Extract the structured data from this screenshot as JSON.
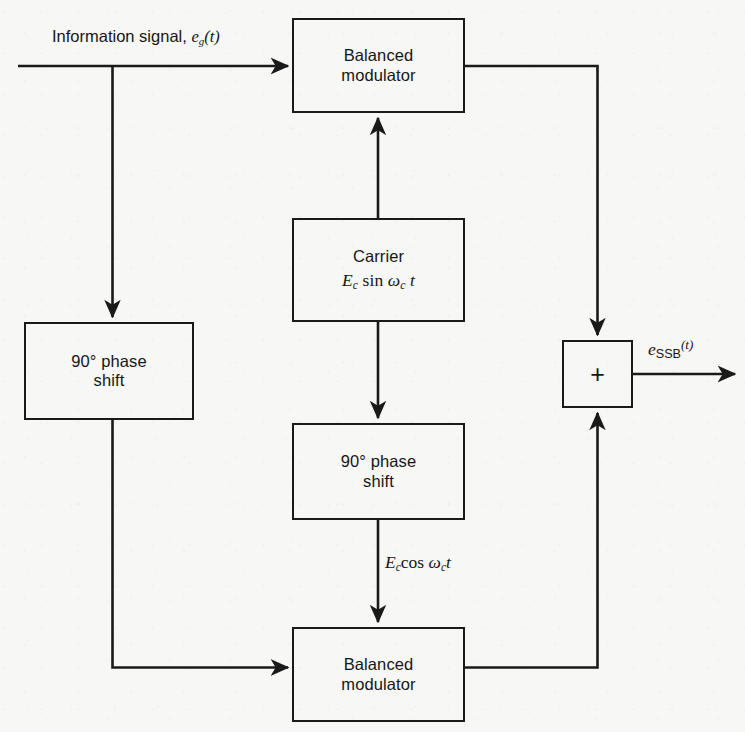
{
  "diagram": {
    "background_color": "#f7f7f5",
    "line_color": "#1a1a1a",
    "text_color": "#161616",
    "input_label": {
      "prefix": "Information signal, ",
      "symbol": "e",
      "subscript": "g",
      "suffix": "(t)"
    },
    "blocks": [
      {
        "name": "balanced-modulator-top",
        "line1": "Balanced",
        "line2": "modulator"
      },
      {
        "name": "carrier",
        "line1": "Carrier",
        "formula": {
          "amplitude": "E",
          "amplitude_sub": "c",
          "function": " sin ",
          "omega": "ω",
          "omega_sub": "c",
          "time": " t"
        }
      },
      {
        "name": "phase-shift-left",
        "line1": "90° phase",
        "line2": "shift"
      },
      {
        "name": "phase-shift-middle",
        "line1": "90° phase",
        "line2": "shift"
      },
      {
        "name": "balanced-modulator-bottom",
        "line1": "Balanced",
        "line2": "modulator"
      },
      {
        "name": "summer",
        "symbol": "+"
      }
    ],
    "signal_labels": [
      {
        "name": "carrier-cos-label",
        "amplitude": "E",
        "amplitude_sub": "c",
        "function": "cos ",
        "omega": "ω",
        "omega_sub": "c",
        "time": "t"
      },
      {
        "name": "output-label",
        "symbol": "e",
        "subscript": "SSB",
        "suffix": "(t)"
      }
    ]
  }
}
